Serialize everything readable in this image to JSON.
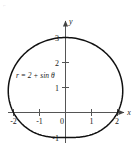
{
  "figure": {
    "name": "polar-limacon-plot",
    "equation_label": "r = 2 + sin θ",
    "corner_artifact": "⌐",
    "axis": {
      "x_label": "x",
      "y_label": "y",
      "x_ticks": [
        "-2",
        "-1",
        "0",
        "1",
        "2"
      ],
      "y_ticks": [
        "-1",
        "1",
        "2",
        "3"
      ]
    },
    "colors": {
      "curve": "#111111",
      "axis": "#555555",
      "text": "#1a1a1a",
      "background": "#ffffff"
    }
  },
  "chart_data": {
    "type": "line",
    "title": "",
    "subtitle": "",
    "xlabel": "x",
    "ylabel": "y",
    "annotations": [
      "r = 2 + sin θ"
    ],
    "legend": [],
    "grid": false,
    "polar_equation": "r = 2 + sin(theta)",
    "xlim": [
      -2.5,
      2.7
    ],
    "ylim": [
      -1.4,
      3.3
    ],
    "xticks": [
      -2,
      -1,
      0,
      1,
      2
    ],
    "yticks": [
      -1,
      1,
      2,
      3
    ],
    "xticklabels": [
      "-2",
      "-1",
      "0",
      "1",
      "2"
    ],
    "yticklabels": [
      "-1",
      "1",
      "2",
      "3"
    ],
    "theta_deg": [
      0,
      15,
      30,
      45,
      60,
      75,
      90,
      105,
      120,
      135,
      150,
      165,
      180,
      195,
      210,
      225,
      240,
      255,
      270,
      285,
      300,
      315,
      330,
      345,
      360
    ],
    "r": [
      2.0,
      2.259,
      2.5,
      2.707,
      2.866,
      2.966,
      3.0,
      2.966,
      2.866,
      2.707,
      2.5,
      2.259,
      2.0,
      1.741,
      1.5,
      1.293,
      1.134,
      1.034,
      1.0,
      1.034,
      1.134,
      1.293,
      1.5,
      1.741,
      2.0
    ],
    "x": [
      2.0,
      2.182,
      2.165,
      1.914,
      1.433,
      0.768,
      0.0,
      -0.768,
      -1.433,
      -1.914,
      -2.165,
      -2.182,
      -2.0,
      -1.682,
      -1.299,
      -0.914,
      -0.567,
      -0.268,
      0.0,
      0.268,
      0.567,
      0.914,
      1.299,
      1.682,
      2.0
    ],
    "y": [
      0.0,
      0.585,
      1.25,
      1.914,
      2.482,
      2.866,
      3.0,
      2.866,
      2.482,
      1.914,
      1.25,
      0.585,
      0.0,
      -0.451,
      -0.75,
      -0.914,
      -0.982,
      -0.999,
      -1.0,
      -0.999,
      -0.982,
      -0.914,
      -0.75,
      -0.451,
      0.0
    ]
  }
}
